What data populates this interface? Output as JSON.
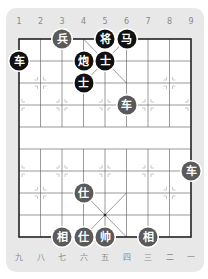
{
  "board": {
    "top_labels": [
      "1",
      "2",
      "3",
      "4",
      "5",
      "6",
      "7",
      "8",
      "9"
    ],
    "bottom_labels": [
      "九",
      "八",
      "七",
      "六",
      "五",
      "四",
      "三",
      "二",
      "一"
    ],
    "colors": {
      "card_bg": "#e8e8e8",
      "board_bg": "#ffffff",
      "black_piece": "#111111",
      "red_piece": "#5a5a5a",
      "grid_line": "#444444"
    },
    "pieces": [
      {
        "label": "兵",
        "side": "red",
        "col": 3,
        "row": 0
      },
      {
        "label": "将",
        "side": "black",
        "col": 5,
        "row": 0
      },
      {
        "label": "马",
        "side": "black",
        "col": 6,
        "row": 0
      },
      {
        "label": "车",
        "side": "black",
        "col": 1,
        "row": 1
      },
      {
        "label": "炮",
        "side": "black",
        "col": 4,
        "row": 1
      },
      {
        "label": "士",
        "side": "black",
        "col": 5,
        "row": 1
      },
      {
        "label": "士",
        "side": "black",
        "col": 4,
        "row": 2
      },
      {
        "label": "车",
        "side": "red",
        "col": 6,
        "row": 3
      },
      {
        "label": "车",
        "side": "red",
        "col": 9,
        "row": 6
      },
      {
        "label": "仕",
        "side": "red",
        "col": 4,
        "row": 7
      },
      {
        "label": "相",
        "side": "red",
        "col": 3,
        "row": 9
      },
      {
        "label": "仕",
        "side": "red",
        "col": 4,
        "row": 9
      },
      {
        "label": "帅",
        "side": "red",
        "col": 5,
        "row": 9
      },
      {
        "label": "相",
        "side": "red",
        "col": 7,
        "row": 9
      }
    ]
  },
  "caption": ""
}
